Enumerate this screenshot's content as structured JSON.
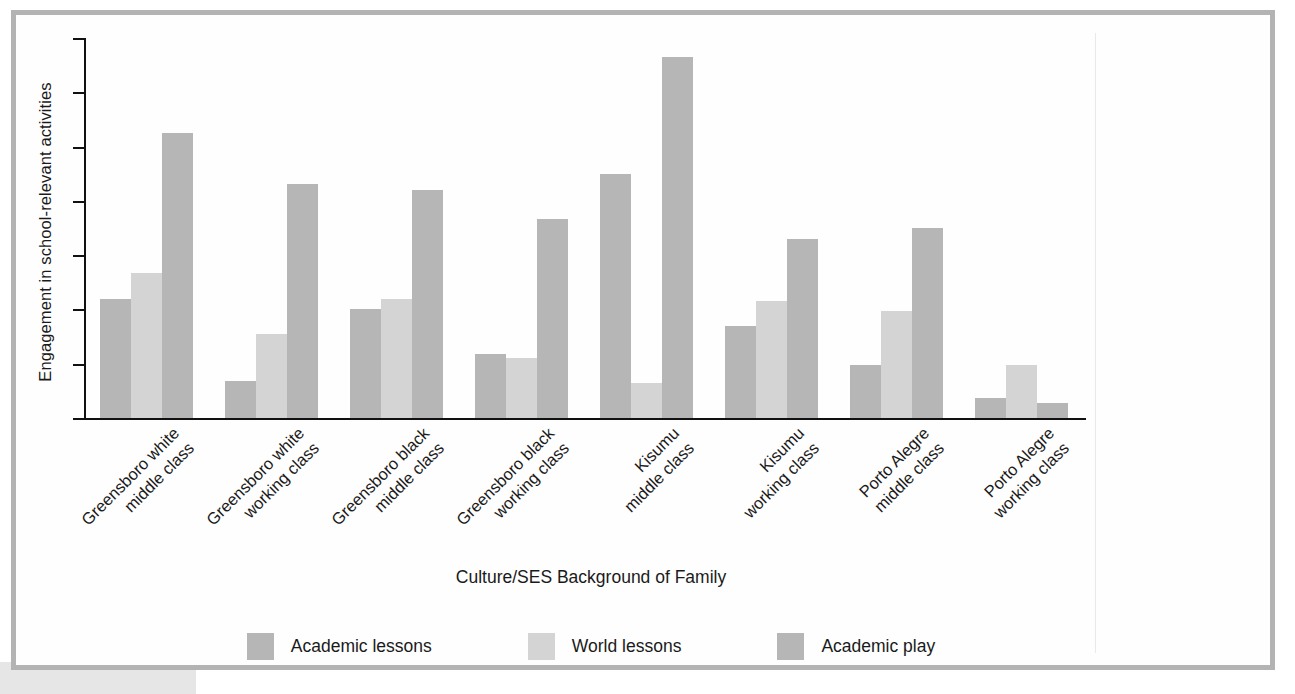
{
  "chart_data": {
    "type": "bar",
    "title": "",
    "xlabel": "Culture/SES Background of Family",
    "ylabel": "Engagement in school-relevant activities",
    "ylim": [
      0,
      7
    ],
    "yticks": [
      "0",
      "1",
      "2",
      "3",
      "4",
      "5",
      "6",
      "7"
    ],
    "grid": false,
    "legend_position": "bottom",
    "categories": [
      "Greensboro white\nmiddle class",
      "Greensboro white\nworking class",
      "Greensboro black\nmiddle class",
      "Greensboro black\nworking class",
      "Kisumu\nmiddle class",
      "Kisumu\nworking class",
      "Porto Alegre\nmiddle class",
      "Porto Alegre\nworking class"
    ],
    "series": [
      {
        "name": "Academic lessons",
        "color": "#b6b6b6",
        "values": [
          2.2,
          0.68,
          2.0,
          1.18,
          4.5,
          1.7,
          0.97,
          0.37
        ]
      },
      {
        "name": "World lessons",
        "color": "#d4d4d4",
        "values": [
          2.67,
          1.55,
          2.2,
          1.1,
          0.65,
          2.15,
          1.97,
          0.98
        ]
      },
      {
        "name": "Academic play",
        "color": "#b6b6b6",
        "values": [
          5.25,
          4.32,
          4.2,
          3.67,
          6.65,
          3.3,
          3.5,
          0.27
        ]
      }
    ]
  },
  "legend": {
    "items": [
      {
        "label": "Academic lessons",
        "color": "#b6b6b6"
      },
      {
        "label": "World lessons",
        "color": "#d4d4d4"
      },
      {
        "label": "Academic play",
        "color": "#b6b6b6"
      }
    ]
  },
  "axes": {
    "y_title": "Engagement in school-relevant activities",
    "x_title": "Culture/SES Background of Family"
  },
  "colors": {
    "frame_border": "#b3b3b3",
    "axis": "#111111",
    "text": "#1a1a1a",
    "series_dark": "#b6b6b6",
    "series_light": "#d4d4d4"
  }
}
